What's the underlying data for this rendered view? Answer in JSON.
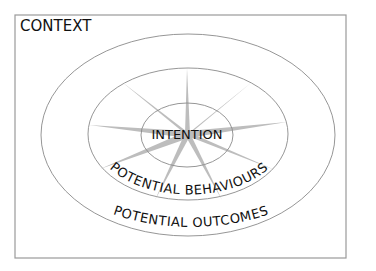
{
  "diagram": {
    "context_label": "CONTEXT",
    "intention_label": "INTENTION",
    "behaviours_label": "POTENTIAL BEHAVIOURS",
    "outcomes_label": "POTENTIAL OUTCOMES",
    "colors": {
      "frame": "#9a9a9a",
      "rings": "#8a8a8a",
      "spokes": "#bdbdbd",
      "text": "#111111"
    }
  }
}
